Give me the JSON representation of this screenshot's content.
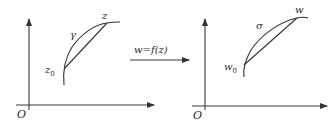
{
  "diagram": {
    "left_plane": {
      "origin_label": "O",
      "curve_label": "γ",
      "start_point_label": "z",
      "start_point_subscript": "0",
      "end_point_label": "z"
    },
    "mapping": {
      "label": "w=f(z)"
    },
    "right_plane": {
      "origin_label": "O",
      "curve_label": "σ",
      "start_point_label": "w",
      "start_point_subscript": "0",
      "end_point_label": "w"
    },
    "colors": {
      "ink": "#333333",
      "background": "#ffffff"
    }
  }
}
